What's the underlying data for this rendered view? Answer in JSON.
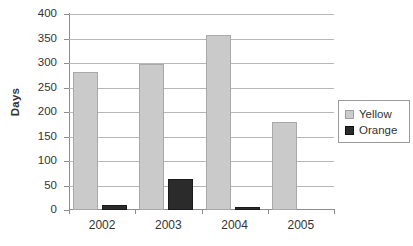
{
  "chart_data": {
    "type": "bar",
    "title": "",
    "xlabel": "",
    "ylabel": "Days",
    "categories": [
      "2002",
      "2003",
      "2004",
      "2005"
    ],
    "series": [
      {
        "name": "Yellow",
        "color": "#cacaca",
        "values": [
          282,
          298,
          357,
          179
        ]
      },
      {
        "name": "Orange",
        "color": "#2b2b2b",
        "values": [
          11,
          63,
          6,
          0
        ]
      }
    ],
    "ylim": [
      0,
      400
    ],
    "ytick_labels": [
      "400",
      "350",
      "300",
      "250",
      "200",
      "150",
      "100",
      "50",
      "0"
    ],
    "ytick_values": [
      400,
      350,
      300,
      250,
      200,
      150,
      100,
      50,
      0
    ],
    "grid": "horizontal",
    "legend_position": "right"
  },
  "legend": {
    "entries": [
      {
        "label": "Yellow",
        "swatch": "light-gray-square"
      },
      {
        "label": "Orange",
        "swatch": "dark-square"
      }
    ]
  }
}
